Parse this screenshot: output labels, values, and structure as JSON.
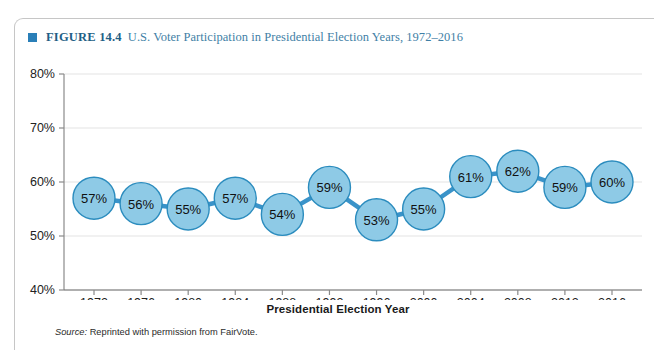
{
  "top_bleed_text": "",
  "figure": {
    "bullet_icon": "square-bullet-icon",
    "number_label": "FIGURE 14.4",
    "title": "U.S. Voter Participation in Presidential Election Years, 1972–2016"
  },
  "source": {
    "label": "Source:",
    "text": "Reprinted with permission from FairVote."
  },
  "colors": {
    "bubble_fill": "#8ecae6",
    "bubble_stroke": "#2b8cbe",
    "connector": "#3a93c9",
    "gridline": "#e3e3e3",
    "axis": "#8a8a8a",
    "header_accent": "#2a7fb8",
    "title_text": "#3f7fa6"
  },
  "chart_data": {
    "type": "line",
    "title": "U.S. Voter Participation in Presidential Election Years, 1972–2016",
    "xlabel": "Presidential Election Year",
    "ylabel": "",
    "categories": [
      "1972",
      "1976",
      "1980",
      "1984",
      "1988",
      "1992",
      "1996",
      "2000",
      "2004",
      "2008",
      "2012",
      "2016"
    ],
    "values": [
      57,
      56,
      55,
      57,
      54,
      59,
      53,
      55,
      61,
      62,
      59,
      60
    ],
    "point_labels": [
      "57%",
      "56%",
      "55%",
      "57%",
      "54%",
      "59%",
      "53%",
      "55%",
      "61%",
      "62%",
      "59%",
      "60%"
    ],
    "ylim": [
      40,
      80
    ],
    "ytick_values": [
      40,
      50,
      60,
      70,
      80
    ],
    "ytick_labels": [
      "40%",
      "50%",
      "60%",
      "70%",
      "80%"
    ],
    "grid": true,
    "legend": "none",
    "marker": "circle-bubble"
  }
}
